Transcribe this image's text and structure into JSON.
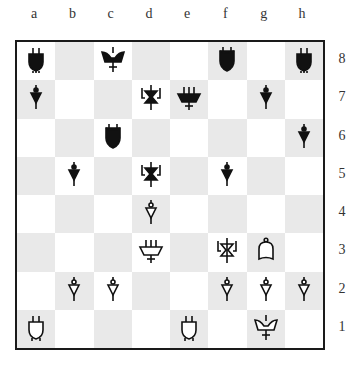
{
  "board": {
    "files": [
      "a",
      "b",
      "c",
      "d",
      "e",
      "f",
      "g",
      "h"
    ],
    "ranks": [
      "8",
      "7",
      "6",
      "5",
      "4",
      "3",
      "2",
      "1"
    ],
    "colors": {
      "light": "#ffffff",
      "dark": "#e9e9e9",
      "border": "#1a1a1a",
      "black_piece": "#111111",
      "white_piece": "#ffffff"
    },
    "pieces": [
      {
        "square": "a8",
        "color": "black",
        "glyph": "tombstone"
      },
      {
        "square": "c8",
        "color": "black",
        "glyph": "fork"
      },
      {
        "square": "f8",
        "color": "black",
        "glyph": "shield"
      },
      {
        "square": "h8",
        "color": "black",
        "glyph": "tombstone"
      },
      {
        "square": "a7",
        "color": "black",
        "glyph": "pawn"
      },
      {
        "square": "d7",
        "color": "black",
        "glyph": "hourglass"
      },
      {
        "square": "e7",
        "color": "black",
        "glyph": "trapezoid"
      },
      {
        "square": "g7",
        "color": "black",
        "glyph": "pawn"
      },
      {
        "square": "c6",
        "color": "black",
        "glyph": "shield"
      },
      {
        "square": "h6",
        "color": "black",
        "glyph": "pawn"
      },
      {
        "square": "b5",
        "color": "black",
        "glyph": "pawn"
      },
      {
        "square": "d5",
        "color": "black",
        "glyph": "hourglass"
      },
      {
        "square": "f5",
        "color": "black",
        "glyph": "pawn"
      },
      {
        "square": "d4",
        "color": "white",
        "glyph": "pawn"
      },
      {
        "square": "d3",
        "color": "white",
        "glyph": "trapezoid"
      },
      {
        "square": "f3",
        "color": "white",
        "glyph": "hourglass"
      },
      {
        "square": "g3",
        "color": "white",
        "glyph": "bell"
      },
      {
        "square": "b2",
        "color": "white",
        "glyph": "pawn"
      },
      {
        "square": "c2",
        "color": "white",
        "glyph": "pawn"
      },
      {
        "square": "f2",
        "color": "white",
        "glyph": "pawn"
      },
      {
        "square": "g2",
        "color": "white",
        "glyph": "pawn"
      },
      {
        "square": "h2",
        "color": "white",
        "glyph": "pawn"
      },
      {
        "square": "a1",
        "color": "white",
        "glyph": "tombstone"
      },
      {
        "square": "e1",
        "color": "white",
        "glyph": "tombstone"
      },
      {
        "square": "g1",
        "color": "white",
        "glyph": "fork"
      }
    ]
  }
}
